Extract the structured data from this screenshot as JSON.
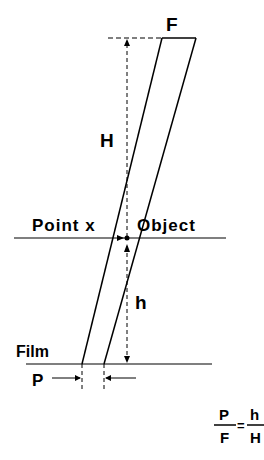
{
  "diagram": {
    "type": "pinhole-projection",
    "labels": {
      "F": "F",
      "H": "H",
      "point_x": "Point x",
      "object": "Object",
      "h": "h",
      "film": "Film",
      "P": "P"
    },
    "formula": {
      "left_num": "P",
      "left_den": "F",
      "equals": "=",
      "right_num": "h",
      "right_den": "H"
    },
    "colors": {
      "ink": "#000000",
      "background": "#ffffff"
    }
  }
}
